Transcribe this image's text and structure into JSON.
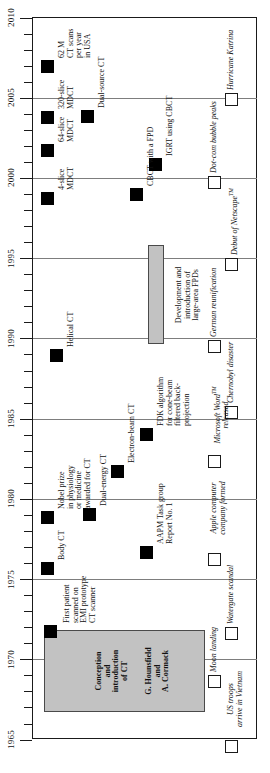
{
  "chart_data": {
    "type": "timeline",
    "title": "",
    "orientation": "vertical-rotated",
    "xlabel": "",
    "ylabel": "Year",
    "axis": {
      "min": 1965,
      "max": 2010,
      "tick_step": 1,
      "major_step": 5,
      "major_ticks": [
        1965,
        1970,
        1975,
        1980,
        1985,
        1990,
        1995,
        2000,
        2005,
        2010
      ],
      "grid": true,
      "grid_color": "#7d7d7d"
    },
    "legend": {
      "position": "none",
      "entries": []
    },
    "series": [
      {
        "name": "CT milestones",
        "marker": "filled-square",
        "color": "#000000",
        "points": [
          {
            "year": 2007,
            "label": "62 M\nCT scans\nper year\nin USA"
          },
          {
            "year": 2005,
            "label": "Dual-source CT"
          },
          {
            "year": 2004,
            "label": "320-slice\nMDCT"
          },
          {
            "year": 2002,
            "label": "64-slice\nMDCT"
          },
          {
            "year": 1999,
            "label": "4-slice\nMDCT"
          },
          {
            "year": 2001,
            "label": "IGRT using CBCT"
          },
          {
            "year": 1999,
            "label": "CBCT with a FPD"
          },
          {
            "year": 1989,
            "label": "Helical CT"
          },
          {
            "year": 1984,
            "label": "FDK algorithm\nfor cone-beam\nfiltered back-\nprojection"
          },
          {
            "year": 1982,
            "label": "Electron-beam CT"
          },
          {
            "year": 1979,
            "label": "Dual-energy CT"
          },
          {
            "year": 1979,
            "label": "Nobel prize\nin physiology\nor medicine\nawarded for CT"
          },
          {
            "year": 1977,
            "label": "AAPM Task group\nReport No. 1"
          },
          {
            "year": 1976,
            "label": "Body CT"
          },
          {
            "year": 1972,
            "label": "First patient\nscanned on\nEMI prototype\nCT scanner"
          }
        ]
      },
      {
        "name": "Historical events",
        "marker": "open-square",
        "color": "#ffffff",
        "points": [
          {
            "year": 2005,
            "label": "Hurricane Katrina"
          },
          {
            "year": 2000,
            "label": "Dot-com bubble peaks"
          },
          {
            "year": 1995,
            "label": "Debut of Netscape"
          },
          {
            "year": 1990,
            "label": "German reunification"
          },
          {
            "year": 1986,
            "label": "Chernobyl disaster"
          },
          {
            "year": 1983,
            "label": "Microsoft Word released"
          },
          {
            "year": 1976,
            "label": "Apple computer company formed"
          },
          {
            "year": 1972,
            "label": "Watergate scandal"
          },
          {
            "year": 1969,
            "label": "Moon landing"
          },
          {
            "year": 1965,
            "label": "US troops arrive in Vietnam"
          }
        ]
      }
    ],
    "bands": [
      {
        "label": "Conception and introduction of CT\nG. Hounsfield and A. Cormack",
        "start_year": 1967,
        "end_year": 1972,
        "color": "#c2c2c2"
      },
      {
        "label": "Development and introduction of large-area FPDs",
        "start_year": 1990,
        "end_year": 1996,
        "color": "#c2c2c2"
      }
    ]
  },
  "axis": {
    "years": [
      "1965",
      "1970",
      "1975",
      "1980",
      "1985",
      "1990",
      "1995",
      "2000",
      "2005",
      "2010"
    ]
  },
  "ct_labels": {
    "scans_62m": "62 M\nCT scans\nper year\nin USA",
    "dual_source": "Dual-source CT",
    "mdct_320": "320-slice\nMDCT",
    "mdct_64": "64-slice\nMDCT",
    "mdct_4": "4-slice\nMDCT",
    "igrt": "IGRT using CBCT",
    "cbct_fpd": "CBCT with a FPD",
    "helical": "Helical CT",
    "fdk": "FDK algorithm\nfor cone-beam\nfiltered back-\nprojection",
    "ebct": "Electron-beam CT",
    "dual_energy": "Dual-energy CT",
    "nobel": "Nobel prize\nin physiology\nor medicine\nawarded for CT",
    "aapm": "AAPM Task group\nReport No. 1",
    "body_ct": "Body CT",
    "first_patient": "First patient\nscanned on\nEMI prototype\nCT scanner"
  },
  "band_labels": {
    "fpd": "Development and\nintroduction of\nlarge-area FPDs",
    "conception_line1": "Conception\nand\nintroduction\nof CT",
    "conception_line2": "G. Hounsfield\nand\nA. Cormack"
  },
  "event_labels": {
    "katrina": "Hurricane Katrina",
    "dotcom": "Dot-com bubble peaks",
    "netscape": "Debut of Netscape",
    "netscape_tm": "TM",
    "reunification": "German reunification",
    "chernobyl": "Chernobyl disaster",
    "msword": "Microsoft Word",
    "msword_tm": "TM",
    "msword_released": "released",
    "apple": "Apple computer\ncompany formed",
    "watergate": "Watergate scandal",
    "moon": "Moon landing",
    "vietnam": "US troops\narrive in Vietnam"
  }
}
